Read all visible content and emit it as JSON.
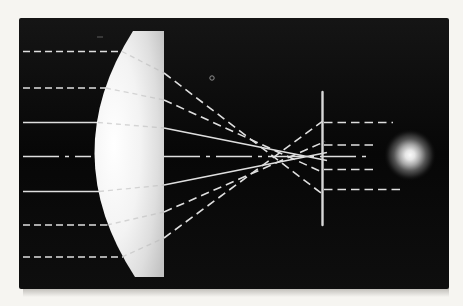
{
  "figure": {
    "canvas": {
      "width": 463,
      "height": 306
    },
    "colors": {
      "paper": "#f6f5f1",
      "panel": "#0b0b0b",
      "ray": "#dfdfdf",
      "ray_internal": "#b8b8b8",
      "screen": "#d8d8d8",
      "lens_core": "#ffffff",
      "lens_edge": "#c3c3c3",
      "spot_core": "#fafafa"
    },
    "panel": {
      "x": 19,
      "y": 18,
      "width": 430,
      "height": 271
    },
    "lens": {
      "path": "M133,31 Q55,154 135,277 L164,277 L164,31 Z"
    },
    "optical_axis": {
      "y": 156.5,
      "segments": [
        {
          "x1": 23,
          "x2": 91
        },
        {
          "x1": 164,
          "x2": 372
        }
      ]
    },
    "incident_rays": [
      {
        "x1": 23,
        "y1": 51.5,
        "x2": 123,
        "y2": 51.5,
        "style": "dashed"
      },
      {
        "x1": 23,
        "y1": 88,
        "x2": 107,
        "y2": 88,
        "style": "dashed"
      },
      {
        "x1": 23,
        "y1": 122.5,
        "x2": 99,
        "y2": 122.5,
        "style": "solid"
      },
      {
        "x1": 23,
        "y1": 191.5,
        "x2": 100,
        "y2": 191.5,
        "style": "solid"
      },
      {
        "x1": 23,
        "y1": 225,
        "x2": 108,
        "y2": 225,
        "style": "dashed"
      },
      {
        "x1": 23,
        "y1": 257,
        "x2": 123,
        "y2": 257,
        "style": "dashed"
      }
    ],
    "internal_rays": [
      {
        "x1": 122,
        "y1": 51.5,
        "x2": 164,
        "y2": 73
      },
      {
        "x1": 106,
        "y1": 88,
        "x2": 164,
        "y2": 100
      },
      {
        "x1": 98,
        "y1": 122.5,
        "x2": 164,
        "y2": 128
      },
      {
        "x1": 99,
        "y1": 191.5,
        "x2": 164,
        "y2": 185
      },
      {
        "x1": 107,
        "y1": 225,
        "x2": 164,
        "y2": 212
      },
      {
        "x1": 122,
        "y1": 257,
        "x2": 164,
        "y2": 238
      }
    ],
    "refracted_rays": [
      {
        "x1": 164,
        "y1": 73,
        "x2": 323,
        "y2": 194.5,
        "style": "dashed"
      },
      {
        "x1": 164,
        "y1": 100,
        "x2": 323,
        "y2": 172.5,
        "style": "dashed"
      },
      {
        "x1": 164,
        "y1": 128,
        "x2": 327,
        "y2": 160.5,
        "style": "solid"
      },
      {
        "x1": 164,
        "y1": 185,
        "x2": 327,
        "y2": 152.5,
        "style": "solid"
      },
      {
        "x1": 164,
        "y1": 212,
        "x2": 325,
        "y2": 141.5,
        "style": "dashed"
      },
      {
        "x1": 164,
        "y1": 238,
        "x2": 325,
        "y2": 119.5,
        "style": "dashed"
      }
    ],
    "screen": {
      "x": 322.5,
      "y1": 92,
      "y2": 225
    },
    "emergent_rays": [
      {
        "y": 122.5,
        "x1": 324,
        "x2": 393
      },
      {
        "y": 145,
        "x1": 324,
        "x2": 376
      },
      {
        "y": 169.5,
        "x1": 324,
        "x2": 377
      },
      {
        "y": 189.5,
        "x1": 324,
        "x2": 401
      }
    ],
    "blur_spot": {
      "cx": 410,
      "cy": 155,
      "r": 26
    },
    "specks": {
      "rings": [
        {
          "cx": 212,
          "cy": 78,
          "r": 2.2
        }
      ],
      "dashes": [
        {
          "x1": 97,
          "y1": 37,
          "x2": 103,
          "y2": 37
        }
      ]
    }
  }
}
